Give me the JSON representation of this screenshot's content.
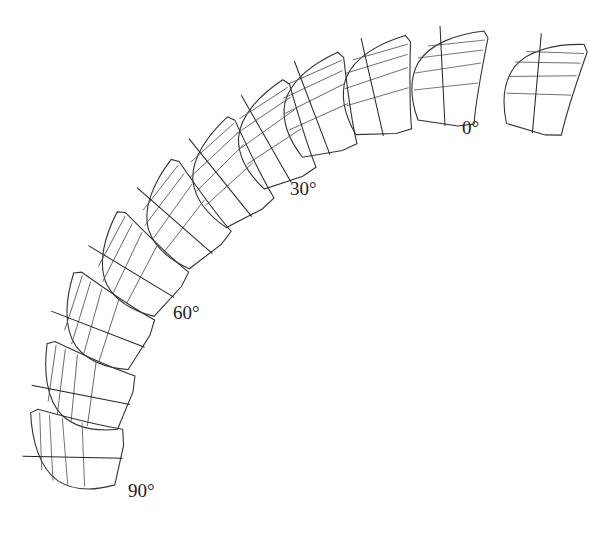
{
  "diagram": {
    "type": "blade-section-sequence",
    "labels": [
      {
        "text": "0°",
        "x": 462,
        "y": 117
      },
      {
        "text": "30°",
        "x": 290,
        "y": 178
      },
      {
        "text": "60°",
        "x": 173,
        "y": 302
      },
      {
        "text": "90°",
        "x": 128,
        "y": 480
      }
    ],
    "sections": [
      {
        "angle": 0,
        "cx": 542,
        "cy": 86
      },
      {
        "angle": 9,
        "cx": 448,
        "cy": 82
      },
      {
        "angle": 18,
        "cx": 378,
        "cy": 92
      },
      {
        "angle": 27,
        "cx": 316,
        "cy": 110
      },
      {
        "angle": 36,
        "cx": 272,
        "cy": 140
      },
      {
        "angle": 45,
        "cx": 228,
        "cy": 178
      },
      {
        "angle": 54,
        "cx": 180,
        "cy": 220
      },
      {
        "angle": 63,
        "cx": 134,
        "cy": 268
      },
      {
        "angle": 72,
        "cx": 100,
        "cy": 322
      },
      {
        "angle": 81,
        "cx": 82,
        "cy": 390
      },
      {
        "angle": 90,
        "cx": 75,
        "cy": 455
      }
    ],
    "line_color": "#333333",
    "background": "#ffffff"
  }
}
